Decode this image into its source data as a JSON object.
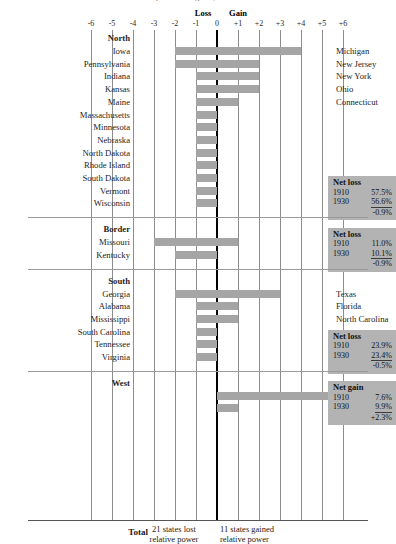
{
  "title_clip": "relative power of regions, 1910 and 1930",
  "axis": {
    "loss_label": "Loss",
    "gain_label": "Gain",
    "ticks": [
      "-6",
      "-5",
      "-4",
      "-3",
      "-2",
      "-1",
      "0",
      "+1",
      "+2",
      "+3",
      "+4",
      "+5",
      "+6"
    ],
    "min": -6,
    "max": 6
  },
  "sections": [
    {
      "name": "North",
      "rows": [
        {
          "left_label": "Iowa",
          "right_label": "Michigan",
          "from": -2,
          "to": 4
        },
        {
          "left_label": "Pennsylvania",
          "right_label": "New Jersey",
          "from": -2,
          "to": 2
        },
        {
          "left_label": "Indiana",
          "right_label": "New York",
          "from": -1,
          "to": 2
        },
        {
          "left_label": "Kansas",
          "right_label": "Ohio",
          "from": -1,
          "to": 2
        },
        {
          "left_label": "Maine",
          "right_label": "Connecticut",
          "from": -1,
          "to": 1
        },
        {
          "left_label": "Massachusetts",
          "right_label": "",
          "from": -1,
          "to": 0
        },
        {
          "left_label": "Minnesota",
          "right_label": "",
          "from": -1,
          "to": 0
        },
        {
          "left_label": "Nebraska",
          "right_label": "",
          "from": -1,
          "to": 0
        },
        {
          "left_label": "North Dakota",
          "right_label": "",
          "from": -1,
          "to": 0
        },
        {
          "left_label": "Rhode Island",
          "right_label": "",
          "from": -1,
          "to": 0
        },
        {
          "left_label": "South Dakota",
          "right_label": "",
          "from": -1,
          "to": 0
        },
        {
          "left_label": "Vermont",
          "right_label": "",
          "from": -1,
          "to": 0
        },
        {
          "left_label": "Wisconsin",
          "right_label": "",
          "from": -1,
          "to": 0
        }
      ],
      "net": {
        "kind": "Net loss",
        "y1": "1910",
        "v1": "57.5%",
        "y2": "1930",
        "v2": "56.6%",
        "change": "-0.9%"
      }
    },
    {
      "name": "Border",
      "rows": [
        {
          "left_label": "Missouri",
          "right_label": "Oklahoma",
          "from": -3,
          "to": 1
        },
        {
          "left_label": "Kentucky",
          "right_label": "",
          "from": -2,
          "to": 0
        }
      ],
      "net": {
        "kind": "Net loss",
        "y1": "1910",
        "v1": "11.0%",
        "y2": "1930",
        "v2": "10.1%",
        "change": "-0.9%"
      }
    },
    {
      "name": "South",
      "rows": [
        {
          "left_label": "Georgia",
          "right_label": "Texas",
          "from": -2,
          "to": 3
        },
        {
          "left_label": "Alabama",
          "right_label": "Florida",
          "from": -1,
          "to": 1
        },
        {
          "left_label": "Mississippi",
          "right_label": "North Carolina",
          "from": -1,
          "to": 1
        },
        {
          "left_label": "South Carolina",
          "right_label": "",
          "from": -1,
          "to": 0
        },
        {
          "left_label": "Tennessee",
          "right_label": "",
          "from": -1,
          "to": 0
        },
        {
          "left_label": "Virginia",
          "right_label": "",
          "from": -1,
          "to": 0
        }
      ],
      "net": {
        "kind": "Net loss",
        "y1": "1910",
        "v1": "23.9%",
        "y2": "1930",
        "v2": "23.4%",
        "change": "-0.5%"
      }
    },
    {
      "name": "West",
      "rows": [
        {
          "left_label": "",
          "right_label": "California",
          "right_sup": "b",
          "from": 0,
          "to": 6.6
        },
        {
          "left_label": "",
          "right_label": "Washington",
          "from": 0,
          "to": 1
        }
      ],
      "net": {
        "kind": "Net gain",
        "y1": "1910",
        "v1": "7.6%",
        "y2": "1930",
        "v2": "9.9%",
        "change": "+2.3%"
      }
    }
  ],
  "total": {
    "label": "Total",
    "loss_text_1": "21 states lost",
    "loss_text_2": "relative power",
    "gain_text_1": "11 states gained",
    "gain_text_2": "relative power"
  },
  "chart_data": {
    "type": "bar",
    "xlabel": "",
    "ylabel": "",
    "xlim": [
      -6,
      6
    ],
    "grid": true,
    "orientation": "horizontal",
    "note": "Each bar is a floating range from a loss value to a gain value on a -6..+6 axis; axis split labelled Loss (left of 0) and Gain (right of 0).",
    "categories": [
      "Iowa",
      "Pennsylvania",
      "Indiana",
      "Kansas",
      "Maine",
      "Massachusetts",
      "Minnesota",
      "Nebraska",
      "North Dakota",
      "Rhode Island",
      "South Dakota",
      "Vermont",
      "Wisconsin",
      "Missouri",
      "Kentucky",
      "Georgia",
      "Alabama",
      "Mississippi",
      "South Carolina",
      "Tennessee",
      "Virginia",
      "California",
      "Washington"
    ],
    "ranges": [
      [
        -2,
        4
      ],
      [
        -2,
        2
      ],
      [
        -1,
        2
      ],
      [
        -1,
        2
      ],
      [
        -1,
        1
      ],
      [
        -1,
        0
      ],
      [
        -1,
        0
      ],
      [
        -1,
        0
      ],
      [
        -1,
        0
      ],
      [
        -1,
        0
      ],
      [
        -1,
        0
      ],
      [
        -1,
        0
      ],
      [
        -1,
        0
      ],
      [
        -3,
        1
      ],
      [
        -2,
        0
      ],
      [
        -2,
        3
      ],
      [
        -1,
        1
      ],
      [
        -1,
        1
      ],
      [
        -1,
        0
      ],
      [
        -1,
        0
      ],
      [
        -1,
        0
      ],
      [
        0,
        6.6
      ],
      [
        0,
        1
      ]
    ],
    "paired_right_labels": [
      "Michigan",
      "New Jersey",
      "New York",
      "Ohio",
      "Connecticut",
      "",
      "",
      "",
      "",
      "",
      "",
      "",
      "",
      "Oklahoma",
      "",
      "Texas",
      "Florida",
      "North Carolina",
      "",
      "",
      "",
      "California",
      "Washington"
    ],
    "regions": [
      {
        "name": "North",
        "net_kind": "Net loss",
        "1910": 57.5,
        "1930": 56.6,
        "change": -0.9
      },
      {
        "name": "Border",
        "net_kind": "Net loss",
        "1910": 11.0,
        "1930": 10.1,
        "change": -0.9
      },
      {
        "name": "South",
        "net_kind": "Net loss",
        "1910": 23.9,
        "1930": 23.4,
        "change": -0.5
      },
      {
        "name": "West",
        "net_kind": "Net gain",
        "1910": 7.6,
        "1930": 9.9,
        "change": 2.3
      }
    ],
    "totals": {
      "states_lost": 21,
      "states_gained": 11
    }
  }
}
